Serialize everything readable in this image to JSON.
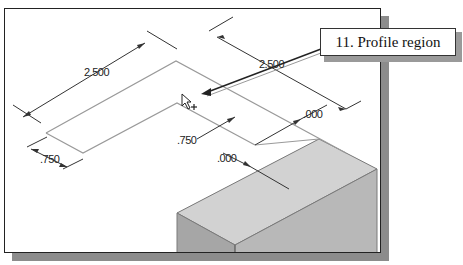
{
  "callout": {
    "label": "11. Profile region"
  },
  "dimensions": {
    "top_left_length": "2.500",
    "top_right_length": "2.500",
    "left_width": ".750",
    "middle_width": ".750",
    "right_offset": ".000",
    "lower_offset": ".000"
  },
  "cursor": {
    "icon": "arrow-select-cursor-icon"
  },
  "colors": {
    "frame_border": "#222222",
    "frame_shadow": "#8c8c8c",
    "dimension_line": "#333333",
    "profile_line": "#9a9a9a",
    "solid_top": "#d0d0d0",
    "solid_front_left": "#a8a8a8",
    "solid_front_right": "#b8b8b8"
  }
}
